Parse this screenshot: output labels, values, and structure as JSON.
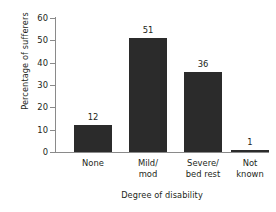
{
  "chart_data": {
    "type": "bar",
    "title": "",
    "categories": [
      "None",
      "Mild/ mod",
      "Severe/ bed rest",
      "Not known"
    ],
    "category_lines": [
      [
        "None"
      ],
      [
        "Mild/",
        "mod"
      ],
      [
        "Severe/",
        "bed rest"
      ],
      [
        "Not",
        "known"
      ]
    ],
    "values": [
      12,
      51,
      36,
      1
    ],
    "value_labels": [
      "12",
      "51",
      "36",
      "1"
    ],
    "xlabel": "Degree of disability",
    "ylabel": "Percentage of sufferers",
    "ylim": [
      0,
      60
    ],
    "yticks": [
      0,
      10,
      20,
      30,
      40,
      50,
      60
    ],
    "ytick_labels": [
      "0",
      "10",
      "20",
      "30",
      "40",
      "50",
      "60"
    ],
    "grid": false,
    "legend": false,
    "bar_color": "#2b2b2b",
    "axis_color": "#8a8a8a",
    "text_color": "#231f20",
    "background": "#ffffff"
  }
}
